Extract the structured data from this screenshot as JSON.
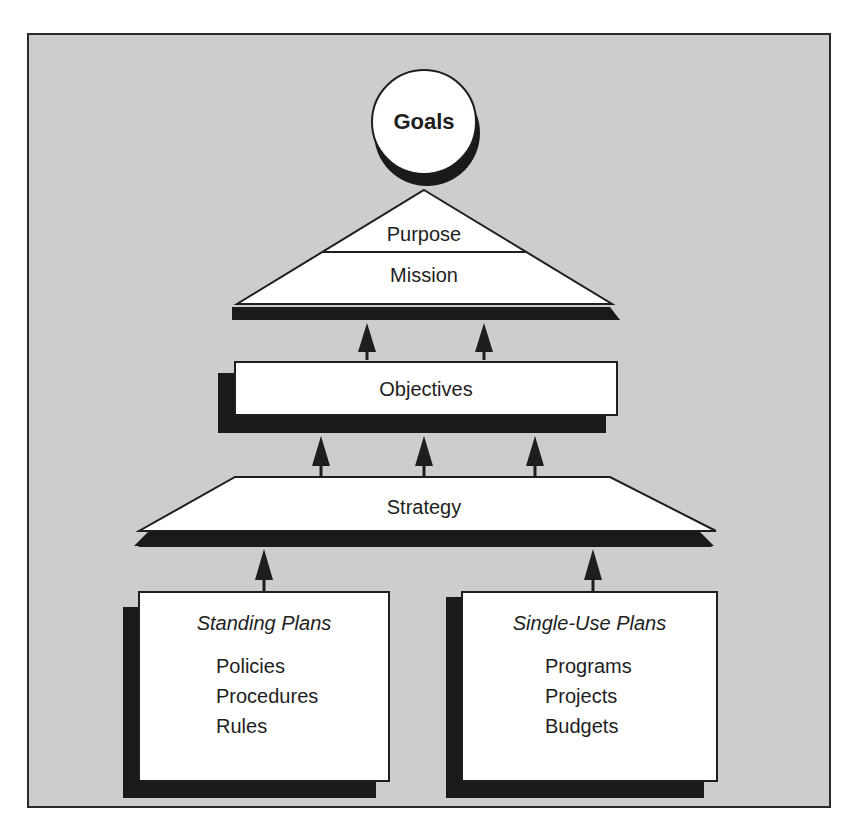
{
  "diagram": {
    "type": "planning-hierarchy",
    "goals": {
      "label": "Goals"
    },
    "pyramid": {
      "top_label": "Purpose",
      "bottom_label": "Mission"
    },
    "objectives": {
      "label": "Objectives"
    },
    "strategy": {
      "label": "Strategy"
    },
    "plans": [
      {
        "title": "Standing Plans",
        "items": [
          "Policies",
          "Procedures",
          "Rules"
        ]
      },
      {
        "title": "Single-Use Plans",
        "items": [
          "Programs",
          "Projects",
          "Budgets"
        ]
      }
    ],
    "arrows": {
      "plans_to_strategy": 2,
      "strategy_to_objectives": 3,
      "objectives_to_mission": 2
    },
    "colors": {
      "background": "#cdcdcd",
      "shape_fill": "#ffffff",
      "shadow": "#1a1a1a",
      "outline": "#1e1e1e"
    }
  }
}
